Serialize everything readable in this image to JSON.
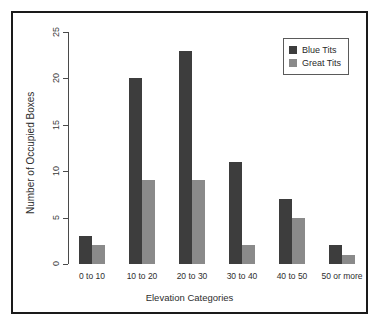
{
  "chart_data": {
    "type": "bar",
    "title": "",
    "xlabel": "Elevation Categories",
    "ylabel": "Number of Occupied Boxes",
    "categories": [
      "0 to 10",
      "10 to 20",
      "20 to 30",
      "30 to 40",
      "40 to 50",
      "50 or more"
    ],
    "series": [
      {
        "name": "Blue Tits",
        "color": "#3d3d3d",
        "values": [
          3,
          20,
          23,
          11,
          7,
          2
        ]
      },
      {
        "name": "Great Tits",
        "color": "#8a8a8a",
        "values": [
          2,
          9,
          9,
          2,
          5,
          1
        ]
      }
    ],
    "ylim": [
      0,
      25
    ],
    "yticks": [
      0,
      5,
      10,
      15,
      20,
      25
    ],
    "ytick_labels": [
      "0",
      "5",
      "10",
      "15",
      "20",
      "25"
    ],
    "grid": false,
    "legend_position": "top-right",
    "grouped": true
  },
  "legend": {
    "entries": [
      {
        "label": "Blue Tits",
        "color": "#3d3d3d",
        "swatch_name": "legend-swatch-blue-tits"
      },
      {
        "label": "Great Tits",
        "color": "#8a8a8a",
        "swatch_name": "legend-swatch-great-tits"
      }
    ]
  },
  "axes": {
    "y_title": "Number of Occupied Boxes",
    "x_title": "Elevation Categories"
  },
  "colors": {
    "series_1": "#3d3d3d",
    "series_2": "#8a8a8a",
    "frame": "#1a1a1a",
    "axis": "#4a4a4a",
    "text": "#2e2e2e",
    "background": "#ffffff"
  }
}
